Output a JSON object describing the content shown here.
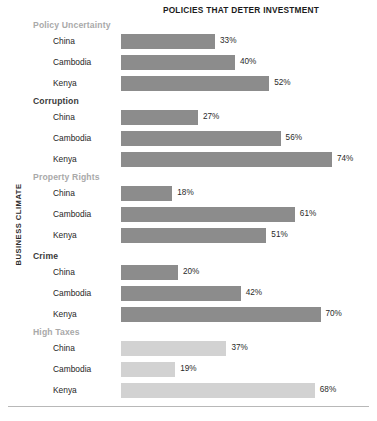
{
  "chart_data": {
    "type": "bar",
    "orientation": "horizontal",
    "title": "POLICIES THAT DETER INVESTMENT",
    "xlabel": "",
    "ylabel": "BUSINESS CLIMATE",
    "xlim": [
      0,
      90
    ],
    "grid": false,
    "legend": "none",
    "value_suffix": "%",
    "categories": [
      "China",
      "Cambodia",
      "Kenya"
    ],
    "groups": [
      {
        "name": "Policy Uncertainty",
        "header_tone": "light",
        "bar_tone": "normal",
        "bars": [
          {
            "category": "China",
            "value": 33,
            "label": "33%"
          },
          {
            "category": "Cambodia",
            "value": 40,
            "label": "40%"
          },
          {
            "category": "Kenya",
            "value": 52,
            "label": "52%"
          }
        ]
      },
      {
        "name": "Corruption",
        "header_tone": "dark",
        "bar_tone": "normal",
        "bars": [
          {
            "category": "China",
            "value": 27,
            "label": "27%"
          },
          {
            "category": "Cambodia",
            "value": 56,
            "label": "56%"
          },
          {
            "category": "Kenya",
            "value": 74,
            "label": "74%"
          }
        ]
      },
      {
        "name": "Property Rights",
        "header_tone": "light",
        "bar_tone": "normal",
        "bars": [
          {
            "category": "China",
            "value": 18,
            "label": "18%"
          },
          {
            "category": "Cambodia",
            "value": 61,
            "label": "61%"
          },
          {
            "category": "Kenya",
            "value": 51,
            "label": "51%"
          }
        ]
      },
      {
        "name": "Crime",
        "header_tone": "dark",
        "bar_tone": "normal",
        "bars": [
          {
            "category": "China",
            "value": 20,
            "label": "20%"
          },
          {
            "category": "Cambodia",
            "value": 42,
            "label": "42%"
          },
          {
            "category": "Kenya",
            "value": 70,
            "label": "70%"
          }
        ]
      },
      {
        "name": "High Taxes",
        "header_tone": "light",
        "bar_tone": "faded",
        "bars": [
          {
            "category": "China",
            "value": 37,
            "label": "37%"
          },
          {
            "category": "Cambodia",
            "value": 19,
            "label": "19%"
          },
          {
            "category": "Kenya",
            "value": 68,
            "label": "68%"
          }
        ]
      }
    ]
  },
  "colors": {
    "bar_normal": "#8c8c8c",
    "bar_faded": "#d2d2d2",
    "header_light": "#a9a9a9",
    "header_dark": "#3a3a3a",
    "text": "#262626",
    "rule": "#b8b8b8",
    "background": "#ffffff"
  },
  "layout": {
    "bar_origin_x": 121,
    "px_per_percent": 2.85,
    "group_tops": [
      20,
      96,
      172,
      251,
      327
    ],
    "row_height": 21,
    "first_row_offset": 13
  }
}
